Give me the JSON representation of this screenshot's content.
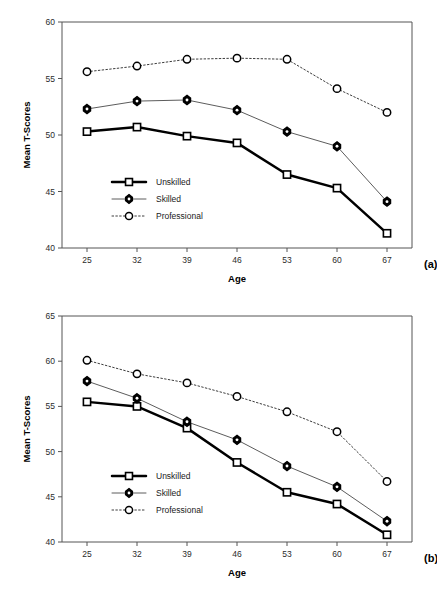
{
  "figure": {
    "panels": [
      {
        "panel_label": "(a)",
        "chart_data": {
          "type": "line",
          "title": "",
          "xlabel": "Age",
          "ylabel": "Mean T-Scores",
          "categories": [
            "25",
            "32",
            "39",
            "46",
            "53",
            "60",
            "67"
          ],
          "xticklabels": [
            "25",
            "32",
            "39",
            "46",
            "53",
            "60",
            "67"
          ],
          "yticklabels": [
            "40",
            "45",
            "50",
            "55",
            "60"
          ],
          "yticks": [
            40,
            45,
            50,
            55,
            60
          ],
          "ylim": [
            40,
            60
          ],
          "grid": false,
          "legend_position": "inside-lower-left",
          "series": [
            {
              "name": "Unskilled",
              "marker": "square",
              "line": "solid-thick",
              "values": [
                50.3,
                50.7,
                49.9,
                49.3,
                46.5,
                45.3,
                41.3
              ]
            },
            {
              "name": "Skilled",
              "marker": "diamond",
              "line": "solid-thin",
              "values": [
                52.3,
                53.0,
                53.1,
                52.2,
                50.3,
                49.0,
                44.1
              ]
            },
            {
              "name": "Professional",
              "marker": "circle",
              "line": "dotted",
              "values": [
                55.6,
                56.1,
                56.7,
                56.8,
                56.7,
                54.1,
                52.0
              ]
            }
          ]
        }
      },
      {
        "panel_label": "(b)",
        "chart_data": {
          "type": "line",
          "title": "",
          "xlabel": "Age",
          "ylabel": "Mean T-Scores",
          "categories": [
            "25",
            "32",
            "39",
            "46",
            "53",
            "60",
            "67"
          ],
          "xticklabels": [
            "25",
            "32",
            "39",
            "46",
            "53",
            "60",
            "67"
          ],
          "yticklabels": [
            "40",
            "45",
            "50",
            "55",
            "60",
            "65"
          ],
          "yticks": [
            40,
            45,
            50,
            55,
            60,
            65
          ],
          "ylim": [
            40,
            65
          ],
          "grid": false,
          "legend_position": "inside-lower-left",
          "series": [
            {
              "name": "Unskilled",
              "marker": "square",
              "line": "solid-thick",
              "values": [
                55.5,
                55.0,
                52.6,
                48.8,
                45.5,
                44.2,
                40.8
              ]
            },
            {
              "name": "Skilled",
              "marker": "diamond",
              "line": "solid-thin",
              "values": [
                57.8,
                55.9,
                53.3,
                51.3,
                48.4,
                46.1,
                42.3
              ]
            },
            {
              "name": "Professional",
              "marker": "circle",
              "line": "dotted",
              "values": [
                60.1,
                58.6,
                57.6,
                56.1,
                54.4,
                52.2,
                46.7
              ]
            }
          ]
        }
      }
    ],
    "colors": {
      "background": "#ffffff",
      "axis": "#555555",
      "series_unskilled": "#000000",
      "series_skilled": "#4a4a4a",
      "series_professional": "#333333",
      "text": "#2b2b2b"
    }
  }
}
